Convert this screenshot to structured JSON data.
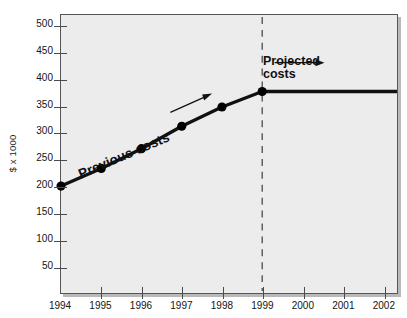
{
  "chart_data": {
    "type": "line",
    "title": "",
    "xlabel": "",
    "ylabel": "$ x 1000",
    "xlim": [
      1994,
      2002.35
    ],
    "ylim": [
      0,
      520
    ],
    "grid": false,
    "legend": "none",
    "x_tick_labels": [
      "1994",
      "1995",
      "1996",
      "1997",
      "1998",
      "1999",
      "2000",
      "2001",
      "2002"
    ],
    "x_ticks": [
      1994,
      1995,
      1996,
      1997,
      1998,
      1999,
      2000,
      2001,
      2002
    ],
    "y_tick_labels": [
      "500",
      "450",
      "400",
      "350",
      "300",
      "250",
      "200",
      "150",
      "100",
      "50"
    ],
    "y_ticks": [
      500,
      450,
      400,
      350,
      300,
      250,
      200,
      150,
      100,
      50
    ],
    "series": [
      {
        "name": "Previous costs",
        "style": "solid-with-markers",
        "x": [
          1994,
          1995,
          1996,
          1997,
          1998,
          1999
        ],
        "values": [
          200,
          233,
          270,
          312,
          348,
          377
        ]
      },
      {
        "name": "Projected costs",
        "style": "solid-flat",
        "x": [
          1999,
          2002.35
        ],
        "values": [
          377,
          377
        ]
      }
    ],
    "annotations": [
      {
        "name": "previous-costs-label",
        "text": "Previous costs",
        "arrow": "up-right"
      },
      {
        "name": "projected-costs-label",
        "line1": "Projected",
        "line2": "costs",
        "arrow": "right"
      },
      {
        "name": "projection-divider",
        "style": "dashed-vertical",
        "at_x": 1999
      }
    ],
    "colors": {
      "plot_background": "#ececec",
      "plot_border": "#565656",
      "line": "#111111",
      "marker": "#000000",
      "divider": "#4a4a4a",
      "text": "#141414"
    }
  }
}
